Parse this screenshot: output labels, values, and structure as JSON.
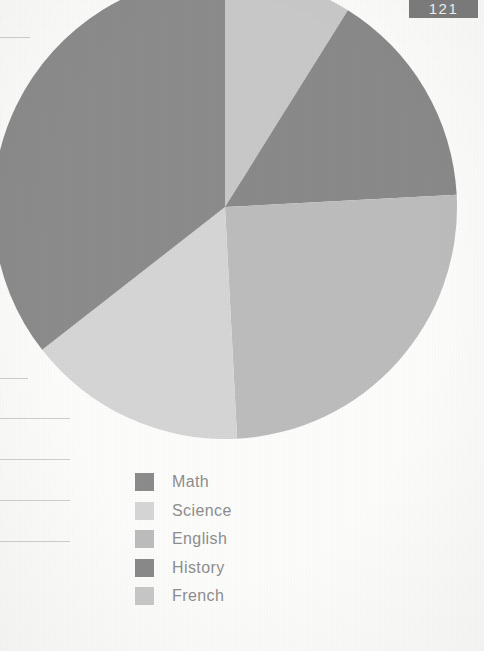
{
  "page": {
    "number_badge": "121",
    "badge_color": "#7d7d7d",
    "background_color": "#fdfdfc"
  },
  "ruled_lines": [
    {
      "y": 37,
      "width": 30
    },
    {
      "y": 378,
      "width": 28
    },
    {
      "y": 418,
      "width": 70
    },
    {
      "y": 459,
      "width": 70
    },
    {
      "y": 500,
      "width": 70
    },
    {
      "y": 541,
      "width": 70
    }
  ],
  "legend": {
    "items": [
      {
        "label": "Math",
        "color": "#8c8c8c"
      },
      {
        "label": "Science",
        "color": "#d6d6d6"
      },
      {
        "label": "English",
        "color": "#bdbdbd"
      },
      {
        "label": "History",
        "color": "#8a8a8a"
      },
      {
        "label": "French",
        "color": "#c9c9c9"
      }
    ]
  },
  "chart_data": {
    "type": "pie",
    "title": "",
    "labels": [
      "Math",
      "Science",
      "English",
      "History",
      "French"
    ],
    "values": [
      35.5,
      15.3,
      25.0,
      15.3,
      8.9
    ],
    "unit": "%",
    "colors": [
      "#8c8c8c",
      "#d6d6d6",
      "#bdbdbd",
      "#8a8a8a",
      "#c9c9c9"
    ],
    "start_angle_deg": 0,
    "direction": "clockwise",
    "legend_position": "bottom",
    "grid": false,
    "slice_order_clockwise_from_top": [
      "French",
      "History",
      "English",
      "Science",
      "Math"
    ],
    "slice_angles_deg": {
      "French": 32,
      "History": 55,
      "English": 90,
      "Science": 55,
      "Math": 128
    },
    "center_px": [
      232,
      232
    ],
    "radius_px": 232
  }
}
